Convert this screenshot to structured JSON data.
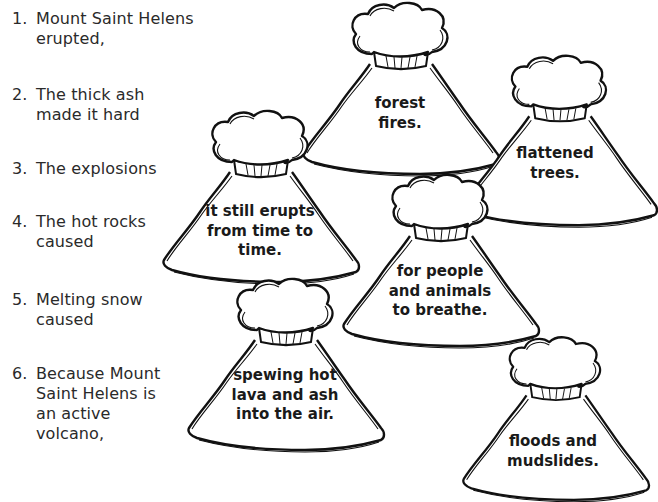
{
  "worksheet": {
    "sentence_starters": [
      {
        "number": "1.",
        "text": "Mount Saint Helens\nerupted,"
      },
      {
        "number": "2.",
        "text": "The thick ash\nmade it hard"
      },
      {
        "number": "3.",
        "text": "The explosions"
      },
      {
        "number": "4.",
        "text": "The hot rocks\ncaused"
      },
      {
        "number": "5.",
        "text": "Melting snow\ncaused"
      },
      {
        "number": "6.",
        "text": "Because Mount\nSaint Helens is\nan active\nvolcano,"
      }
    ],
    "volcano_endings": [
      {
        "id": "forest-fires",
        "text": "forest\nfires."
      },
      {
        "id": "flattened-trees",
        "text": "flattened\ntrees."
      },
      {
        "id": "still-erupts",
        "text": "it still erupts\nfrom time to\ntime."
      },
      {
        "id": "people-breathe",
        "text": "for people\nand animals\nto breathe."
      },
      {
        "id": "spewing-lava",
        "text": "spewing hot\nlava and ash\ninto the air."
      },
      {
        "id": "floods-mudslides",
        "text": "floods and\nmudslides."
      }
    ]
  }
}
